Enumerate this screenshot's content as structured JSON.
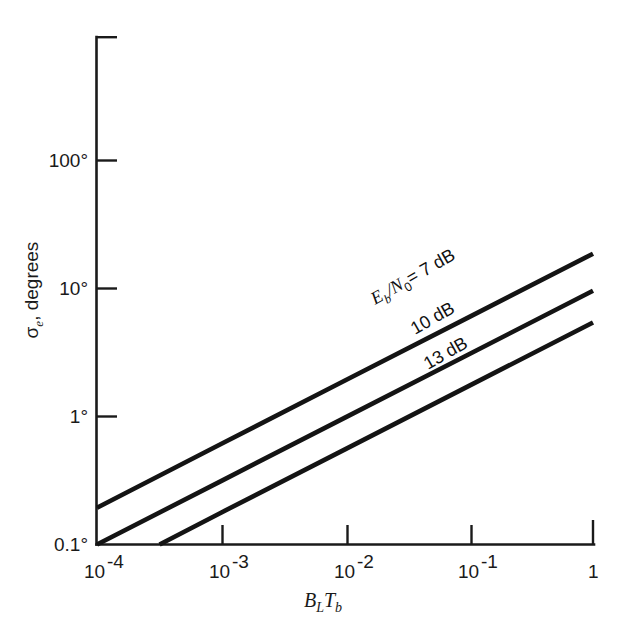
{
  "chart_data": {
    "type": "line",
    "title": "",
    "xlabel": "B_L T_b",
    "xlabel_parts": {
      "b1": "B",
      "sub1": "L",
      "b2": "T",
      "sub2": "b"
    },
    "ylabel": "σₑ, degrees",
    "ylabel_parts": {
      "symbol": "σ",
      "subscript": "e",
      "rest": ", degrees"
    },
    "xscale": "log",
    "yscale": "log",
    "xlim": [
      0.0001,
      1
    ],
    "ylim": [
      0.1,
      1000
    ],
    "grid": false,
    "legend": "inline-curve-labels",
    "x_ticks": [
      {
        "value": 0.0001,
        "mantissa": "10",
        "exponent": "-4",
        "label": "10-4"
      },
      {
        "value": 0.001,
        "mantissa": "10",
        "exponent": "-3",
        "label": "10-3"
      },
      {
        "value": 0.01,
        "mantissa": "10",
        "exponent": "-2",
        "label": "10-2"
      },
      {
        "value": 0.1,
        "mantissa": "10",
        "exponent": "-1",
        "label": "10-1"
      },
      {
        "value": 1,
        "mantissa": "1",
        "exponent": "",
        "label": "1"
      }
    ],
    "y_ticks": [
      {
        "value": 0.1,
        "label": "0.1°"
      },
      {
        "value": 1,
        "label": "1°"
      },
      {
        "value": 10,
        "label": "10°"
      },
      {
        "value": 100,
        "label": "100°"
      }
    ],
    "series": [
      {
        "name": "Eb/N0 = 7 dB",
        "label_text": "= 7 dB",
        "label_prefix_E": "E",
        "label_prefix_b": "b",
        "label_prefix_slash": "/N",
        "label_prefix_0": "0",
        "eb_n0_db": 7,
        "points": [
          {
            "x": 0.0001,
            "y": 0.195
          },
          {
            "x": 0.001,
            "y": 0.62
          },
          {
            "x": 0.01,
            "y": 1.96
          },
          {
            "x": 0.1,
            "y": 6.2
          },
          {
            "x": 1,
            "y": 19.6
          }
        ]
      },
      {
        "name": "10 dB",
        "label_text": "10 dB",
        "eb_n0_db": 10,
        "points": [
          {
            "x": 0.0001,
            "y": 0.1
          },
          {
            "x": 0.001,
            "y": 0.316
          },
          {
            "x": 0.01,
            "y": 1.0
          },
          {
            "x": 0.1,
            "y": 3.16
          },
          {
            "x": 1,
            "y": 10.0
          }
        ]
      },
      {
        "name": "13 dB",
        "label_text": "13 dB",
        "eb_n0_db": 13,
        "points": [
          {
            "x": 0.00032,
            "y": 0.1
          },
          {
            "x": 0.001,
            "y": 0.178
          },
          {
            "x": 0.01,
            "y": 0.562
          },
          {
            "x": 0.1,
            "y": 1.78
          },
          {
            "x": 1,
            "y": 5.62
          }
        ]
      }
    ],
    "colors": {
      "axis": "#1a1a1a",
      "curve": "#141414",
      "background": "#ffffff"
    }
  }
}
